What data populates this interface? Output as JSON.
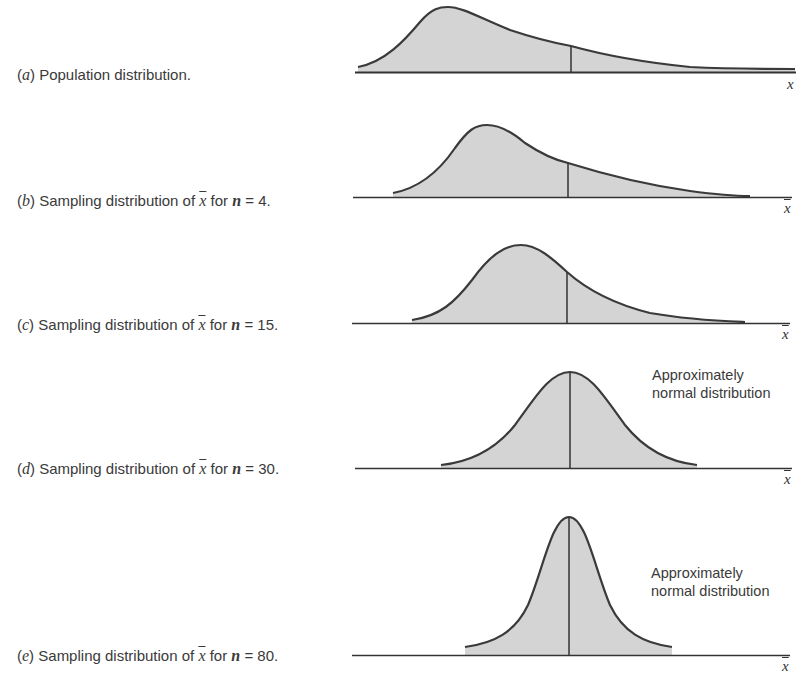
{
  "panels": [
    {
      "id": "a",
      "letter": "a",
      "text": "Population distribution.",
      "axis_label": "x",
      "axis_overbar": false,
      "annotation": null
    },
    {
      "id": "b",
      "letter": "b",
      "text_before": "Sampling distribution of",
      "var": "x",
      "text_mid": "for",
      "n_var": "n",
      "n_value": "= 4.",
      "axis_label": "x",
      "axis_overbar": true
    },
    {
      "id": "c",
      "letter": "c",
      "text_before": "Sampling distribution of",
      "var": "x",
      "text_mid": "for",
      "n_var": "n",
      "n_value": "= 15.",
      "axis_label": "x",
      "axis_overbar": true
    },
    {
      "id": "d",
      "letter": "d",
      "text_before": "Sampling distribution of",
      "var": "x",
      "text_mid": "for",
      "n_var": "n",
      "n_value": "= 30.",
      "axis_label": "x",
      "axis_overbar": true,
      "annotation_line1": "Approximately",
      "annotation_line2": "normal distribution"
    },
    {
      "id": "e",
      "letter": "e",
      "text_before": "Sampling distribution of",
      "var": "x",
      "text_mid": "for",
      "n_var": "n",
      "n_value": "= 80.",
      "axis_label": "x",
      "axis_overbar": true,
      "annotation_line1": "Approximately",
      "annotation_line2": "normal distribution"
    }
  ],
  "colors": {
    "fill": "#d4d4d4",
    "curve": "#3a3a3a",
    "axis": "#333333"
  }
}
